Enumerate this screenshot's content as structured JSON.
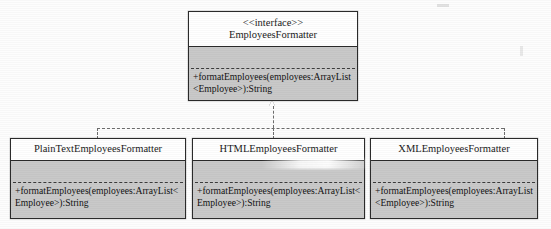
{
  "diagram": {
    "type": "uml-class-diagram",
    "relationship": "realization",
    "interface": {
      "stereotype": "<<interface>>",
      "name": "EmployeesFormatter",
      "attributes": [],
      "operations": [
        "+formatEmployees(employees:ArrayList<Employee>):String"
      ]
    },
    "implementations": [
      {
        "name": "PlainTextEmployeesFormatter",
        "attributes": [],
        "operations": [
          "+formatEmployees(employees:ArrayList<Employee>):String"
        ]
      },
      {
        "name": "HTMLEmployeesFormatter",
        "attributes": [],
        "operations": [
          "+formatEmployees(employees:ArrayList<Employee>):String"
        ]
      },
      {
        "name": "XMLEmployeesFormatter",
        "attributes": [],
        "operations": [
          "+formatEmployees(employees:ArrayList<Employee>):String"
        ]
      }
    ],
    "colors": {
      "box_fill": "#c9c9c9",
      "title_fill": "#ffffff",
      "border": "#2b2b2b",
      "connector": "#6d6d6d",
      "text": "#111111"
    }
  }
}
